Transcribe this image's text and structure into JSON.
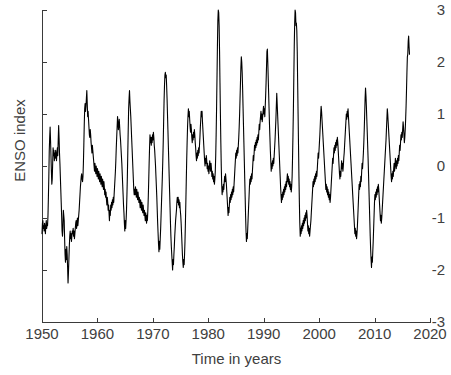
{
  "chart_data": {
    "type": "line",
    "title": "",
    "xlabel": "Time in years",
    "ylabel": "ENSO index",
    "xlim": [
      1950,
      2020
    ],
    "ylim": [
      -3,
      3
    ],
    "xticks": [
      1950,
      1960,
      1970,
      1980,
      1990,
      2000,
      2010,
      2020
    ],
    "xtick_labels": [
      "1950",
      "1960",
      "1970",
      "1980",
      "1990",
      "2000",
      "2010",
      "2020"
    ],
    "yticks": [
      3,
      2,
      1,
      0,
      -1,
      -2,
      -3
    ],
    "ytick_labels": [
      "3",
      "2",
      "1",
      "0",
      "-1",
      "-2",
      "-3"
    ],
    "grid": false,
    "legend": false,
    "line_color": "#000000",
    "line_width": 1.1,
    "axis_color": "#3a3a3a",
    "text_color": "#404040",
    "background": "#ffffff",
    "x_start": 1950.0,
    "x_end": 2016.3,
    "sample_interval_years": 0.08333,
    "series": [
      {
        "name": "ENSO index",
        "values": [
          -1.3,
          -1.1,
          -1.05,
          -1.2,
          -1.15,
          -1.25,
          -1.1,
          -1.2,
          -1.3,
          -1.15,
          -1.05,
          -1.2,
          -1.1,
          -1.15,
          -0.95,
          -0.6,
          -0.2,
          0.3,
          0.55,
          0.75,
          0.5,
          0.2,
          -0.1,
          -0.35,
          -0.25,
          0.05,
          0.35,
          0.2,
          0.3,
          0.1,
          0.25,
          0.15,
          0.3,
          0.2,
          0.1,
          0.25,
          0.35,
          0.2,
          0.5,
          0.78,
          0.55,
          0.25,
          0.05,
          -0.2,
          -0.45,
          -0.7,
          -0.95,
          -1.25,
          -1.35,
          -1.2,
          -0.85,
          -0.95,
          -1.05,
          -1.4,
          -1.7,
          -1.85,
          -1.6,
          -1.8,
          -1.55,
          -1.7,
          -1.95,
          -2.25,
          -2.05,
          -1.8,
          -1.55,
          -1.35,
          -1.25,
          -1.4,
          -1.3,
          -1.45,
          -1.35,
          -1.25,
          -1.3,
          -1.2,
          -1.35,
          -1.25,
          -1.4,
          -1.3,
          -1.2,
          -1.1,
          -1.05,
          -1.2,
          -1.1,
          -1.0,
          -1.15,
          -1.05,
          -0.95,
          -0.85,
          -0.7,
          -0.55,
          -0.4,
          -0.3,
          -0.2,
          -0.15,
          -0.25,
          -0.3,
          -0.2,
          0.05,
          0.4,
          0.8,
          1.1,
          1.2,
          1.05,
          1.15,
          1.3,
          1.45,
          1.2,
          0.95,
          1.05,
          0.9,
          0.75,
          0.6,
          0.55,
          0.7,
          0.6,
          0.45,
          0.35,
          0.25,
          0.4,
          0.3,
          0.2,
          0.1,
          0.0,
          -0.1,
          0.05,
          -0.05,
          -0.15,
          0.0,
          -0.1,
          -0.2,
          -0.05,
          -0.15,
          -0.25,
          -0.1,
          -0.2,
          -0.3,
          -0.15,
          -0.25,
          -0.35,
          -0.2,
          -0.3,
          -0.4,
          -0.25,
          -0.35,
          -0.45,
          -0.3,
          -0.4,
          -0.55,
          -0.45,
          -0.6,
          -0.5,
          -0.65,
          -0.75,
          -0.6,
          -0.7,
          -0.85,
          -0.75,
          -0.9,
          -1.05,
          -0.85,
          -0.95,
          -0.75,
          -0.85,
          -0.7,
          -0.8,
          -0.65,
          -0.75,
          -0.6,
          -0.7,
          -0.55,
          -0.4,
          -0.25,
          -0.1,
          0.1,
          0.35,
          0.55,
          0.75,
          0.95,
          0.85,
          0.7,
          0.8,
          0.9,
          0.75,
          0.6,
          0.5,
          0.35,
          0.2,
          0.05,
          -0.15,
          -0.35,
          -0.55,
          -0.75,
          -0.9,
          -1.1,
          -1.25,
          -1.05,
          -1.2,
          -1.05,
          -0.85,
          -0.55,
          -0.2,
          0.25,
          0.7,
          1.1,
          1.3,
          1.45,
          1.25,
          1.1,
          0.95,
          0.75,
          0.55,
          0.35,
          0.15,
          -0.05,
          -0.25,
          -0.45,
          -0.55,
          -0.45,
          -0.55,
          -0.4,
          -0.5,
          -0.6,
          -0.45,
          -0.55,
          -0.65,
          -0.5,
          -0.6,
          -0.7,
          -0.6,
          -0.7,
          -0.8,
          -0.65,
          -0.75,
          -0.85,
          -0.7,
          -0.8,
          -0.9,
          -0.75,
          -0.85,
          -0.95,
          -0.85,
          -0.95,
          -1.05,
          -0.9,
          -1.0,
          -1.1,
          -0.95,
          -1.05,
          -0.85,
          -0.6,
          -0.3,
          0.05,
          0.35,
          0.6,
          0.45,
          0.55,
          0.4,
          0.55,
          0.45,
          0.6,
          0.5,
          0.65,
          0.55,
          0.4,
          0.3,
          0.15,
          0.0,
          -0.2,
          -0.4,
          -0.6,
          -0.85,
          -1.1,
          -1.3,
          -1.5,
          -1.65,
          -1.45,
          -1.6,
          -1.4,
          -1.2,
          -0.95,
          -0.7,
          -0.45,
          -0.2,
          0.1,
          0.45,
          0.85,
          1.25,
          1.55,
          1.75,
          1.8,
          1.7,
          1.75,
          1.55,
          1.3,
          1.0,
          0.7,
          0.4,
          0.1,
          -0.2,
          -0.5,
          -0.8,
          -1.1,
          -1.35,
          -1.55,
          -1.7,
          -1.85,
          -2.0,
          -1.8,
          -1.9,
          -1.7,
          -1.55,
          -1.35,
          -1.2,
          -1.05,
          -0.95,
          -0.85,
          -0.7,
          -0.6,
          -0.7,
          -0.6,
          -0.75,
          -0.65,
          -0.8,
          -0.7,
          -0.85,
          -0.95,
          -1.1,
          -1.3,
          -1.5,
          -1.7,
          -1.85,
          -1.95,
          -1.8,
          -1.9,
          -1.7,
          -1.45,
          -1.1,
          -0.7,
          -0.3,
          0.1,
          0.45,
          0.75,
          0.95,
          1.1,
          0.95,
          1.05,
          0.9,
          0.75,
          0.65,
          0.8,
          0.7,
          0.55,
          0.45,
          0.6,
          0.5,
          0.65,
          0.55,
          0.7,
          0.6,
          0.45,
          0.35,
          0.2,
          0.1,
          0.25,
          0.15,
          0.3,
          0.2,
          0.35,
          0.25,
          0.4,
          0.55,
          0.75,
          0.9,
          1.05,
          0.95,
          1.05,
          0.85,
          0.7,
          0.55,
          0.4,
          0.25,
          0.1,
          0.0,
          0.15,
          0.05,
          0.2,
          0.1,
          -0.05,
          0.05,
          -0.1,
          0.0,
          -0.15,
          -0.05,
          0.1,
          0.0,
          -0.1,
          0.05,
          -0.05,
          -0.2,
          -0.1,
          -0.25,
          -0.15,
          -0.3,
          -0.2,
          -0.35,
          -0.25,
          -0.1,
          0.2,
          0.6,
          1.1,
          1.7,
          2.3,
          2.8,
          3.0,
          2.95,
          2.7,
          2.2,
          1.6,
          1.0,
          0.45,
          0.0,
          -0.35,
          -0.55,
          -0.4,
          -0.5,
          -0.35,
          -0.45,
          -0.3,
          -0.2,
          -0.3,
          -0.15,
          -0.25,
          -0.35,
          -0.5,
          -0.65,
          -0.8,
          -0.95,
          -0.8,
          -0.9,
          -0.75,
          -0.6,
          -0.7,
          -0.55,
          -0.65,
          -0.5,
          -0.6,
          -0.45,
          -0.55,
          -0.4,
          -0.5,
          -0.35,
          -0.2,
          -0.05,
          0.1,
          0.25,
          0.15,
          0.3,
          0.2,
          0.35,
          0.25,
          0.4,
          0.55,
          0.75,
          1.0,
          1.3,
          1.6,
          1.9,
          2.1,
          2.0,
          1.8,
          1.5,
          1.15,
          0.8,
          0.45,
          0.1,
          -0.25,
          -0.6,
          -0.95,
          -1.25,
          -1.45,
          -1.3,
          -1.4,
          -1.2,
          -1.0,
          -0.8,
          -0.6,
          -0.4,
          -0.25,
          -0.35,
          -0.2,
          -0.3,
          -0.15,
          -0.25,
          -0.1,
          0.05,
          0.2,
          0.1,
          0.25,
          0.4,
          0.3,
          0.45,
          0.35,
          0.5,
          0.4,
          0.55,
          0.45,
          0.6,
          0.5,
          0.65,
          0.8,
          0.7,
          0.85,
          0.95,
          1.05,
          0.9,
          1.0,
          0.85,
          0.95,
          1.05,
          1.15,
          1.0,
          1.1,
          0.95,
          1.15,
          1.35,
          1.6,
          1.9,
          2.2,
          2.25,
          2.0,
          1.7,
          1.4,
          1.1,
          0.8,
          0.55,
          0.3,
          0.1,
          -0.1,
          0.05,
          -0.05,
          0.1,
          0.0,
          0.15,
          0.05,
          0.2,
          0.35,
          0.5,
          0.7,
          0.9,
          1.15,
          1.4,
          1.2,
          1.0,
          0.8,
          0.6,
          0.4,
          0.2,
          0.0,
          -0.2,
          -0.4,
          -0.55,
          -0.7,
          -0.55,
          -0.65,
          -0.5,
          -0.6,
          -0.45,
          -0.55,
          -0.4,
          -0.5,
          -0.35,
          -0.45,
          -0.3,
          -0.4,
          -0.25,
          -0.15,
          -0.3,
          -0.2,
          -0.35,
          -0.25,
          -0.4,
          -0.3,
          -0.45,
          -0.35,
          -0.5,
          -0.4,
          -0.2,
          0.15,
          0.6,
          1.1,
          1.7,
          2.3,
          2.75,
          3.0,
          2.95,
          2.7,
          2.75,
          2.6,
          2.2,
          1.6,
          1.0,
          0.4,
          -0.2,
          -0.7,
          -1.1,
          -1.35,
          -1.2,
          -1.3,
          -1.15,
          -1.25,
          -1.1,
          -1.2,
          -1.05,
          -1.15,
          -1.0,
          -1.1,
          -0.95,
          -1.05,
          -0.9,
          -1.0,
          -0.85,
          -0.95,
          -1.1,
          -1.25,
          -1.15,
          -1.3,
          -1.2,
          -1.35,
          -1.25,
          -1.15,
          -1.05,
          -0.9,
          -0.75,
          -0.6,
          -0.45,
          -0.3,
          -0.4,
          -0.25,
          -0.35,
          -0.2,
          -0.3,
          -0.15,
          -0.25,
          -0.1,
          -0.2,
          -0.05,
          0.1,
          0.25,
          0.15,
          0.3,
          0.45,
          0.6,
          0.8,
          1.0,
          1.15,
          1.05,
          0.9,
          0.75,
          0.6,
          0.45,
          0.3,
          0.15,
          0.0,
          -0.15,
          -0.3,
          -0.45,
          -0.35,
          -0.5,
          -0.4,
          -0.55,
          -0.45,
          -0.6,
          -0.5,
          -0.65,
          -0.55,
          -0.7,
          -0.6,
          -0.45,
          -0.3,
          -0.15,
          0.0,
          0.15,
          0.05,
          0.2,
          0.35,
          0.25,
          0.4,
          0.3,
          0.45,
          0.35,
          0.5,
          0.4,
          0.55,
          0.45,
          0.3,
          0.15,
          0.0,
          -0.15,
          -0.25,
          -0.1,
          -0.2,
          -0.05,
          0.1,
          -0.05,
          0.05,
          -0.1,
          0.0,
          0.15,
          0.25,
          0.4,
          0.55,
          0.7,
          0.85,
          1.0,
          0.9,
          1.05,
          0.95,
          1.1,
          0.95,
          0.8,
          0.65,
          0.5,
          0.35,
          0.2,
          0.05,
          -0.1,
          -0.25,
          -0.4,
          -0.55,
          -0.7,
          -0.85,
          -1.0,
          -1.15,
          -1.3,
          -1.2,
          -1.35,
          -1.25,
          -1.4,
          -1.3,
          -1.15,
          -0.95,
          -0.75,
          -0.55,
          -0.35,
          -0.45,
          -0.3,
          -0.4,
          -0.2,
          -0.3,
          -0.1,
          0.05,
          -0.05,
          0.1,
          0.25,
          0.45,
          0.7,
          1.0,
          1.3,
          1.5,
          1.35,
          1.15,
          0.9,
          0.65,
          0.4,
          0.15,
          -0.15,
          -0.45,
          -0.75,
          -1.05,
          -1.35,
          -1.6,
          -1.8,
          -1.95,
          -1.75,
          -1.85,
          -1.65,
          -1.45,
          -1.2,
          -0.95,
          -0.7,
          -0.55,
          -0.65,
          -0.5,
          -0.6,
          -0.45,
          -0.55,
          -0.4,
          -0.5,
          -0.35,
          -0.45,
          -0.6,
          -0.75,
          -0.9,
          -1.05,
          -0.95,
          -1.1,
          -1.0,
          -0.85,
          -0.7,
          -0.55,
          -0.4,
          -0.25,
          -0.1,
          0.05,
          0.2,
          0.35,
          0.5,
          0.7,
          0.9,
          1.1,
          1.0,
          0.85,
          0.7,
          0.55,
          0.4,
          0.25,
          0.1,
          -0.05,
          -0.2,
          -0.3,
          -0.15,
          -0.25,
          -0.1,
          -0.2,
          -0.05,
          0.05,
          -0.1,
          0.0,
          0.15,
          0.05,
          -0.05,
          0.1,
          0.0,
          0.15,
          0.05,
          0.2,
          0.1,
          0.25,
          0.4,
          0.3,
          0.45,
          0.6,
          0.5,
          0.65,
          0.55,
          0.7,
          0.85,
          0.75,
          0.6,
          0.45,
          0.55,
          0.7,
          0.9,
          1.15,
          1.45,
          1.8,
          2.1,
          2.15,
          2.4,
          2.5,
          2.3,
          2.15
        ]
      }
    ]
  }
}
